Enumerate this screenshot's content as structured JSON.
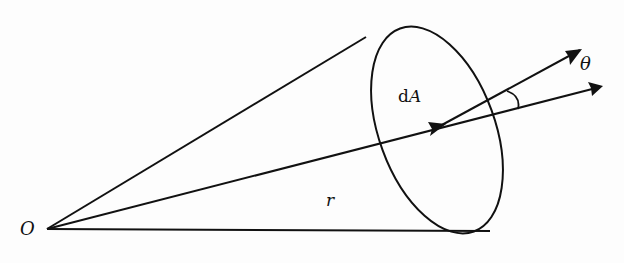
{
  "diagram": {
    "labels": {
      "origin": "O",
      "radius": "r",
      "area_prefix": "d",
      "area_var": "A",
      "angle": "θ"
    },
    "colors": {
      "stroke": "#111111",
      "background": "#fdfdfd"
    },
    "elements": [
      {
        "id": "cone-upper-edge",
        "type": "line",
        "from": "O",
        "to": "ellipse-top"
      },
      {
        "id": "cone-lower-edge",
        "type": "line",
        "from": "O",
        "to": "ellipse-bottom"
      },
      {
        "id": "radius-vector",
        "type": "arrow",
        "from": "O",
        "to": "dA-center",
        "label": "r"
      },
      {
        "id": "area-ellipse",
        "type": "ellipse",
        "label": "dA"
      },
      {
        "id": "normal-vector",
        "type": "arrow",
        "from": "dA-center"
      },
      {
        "id": "radial-extension",
        "type": "arrow",
        "from": "dA-center"
      },
      {
        "id": "angle-arc",
        "type": "arc",
        "label": "θ"
      }
    ]
  }
}
